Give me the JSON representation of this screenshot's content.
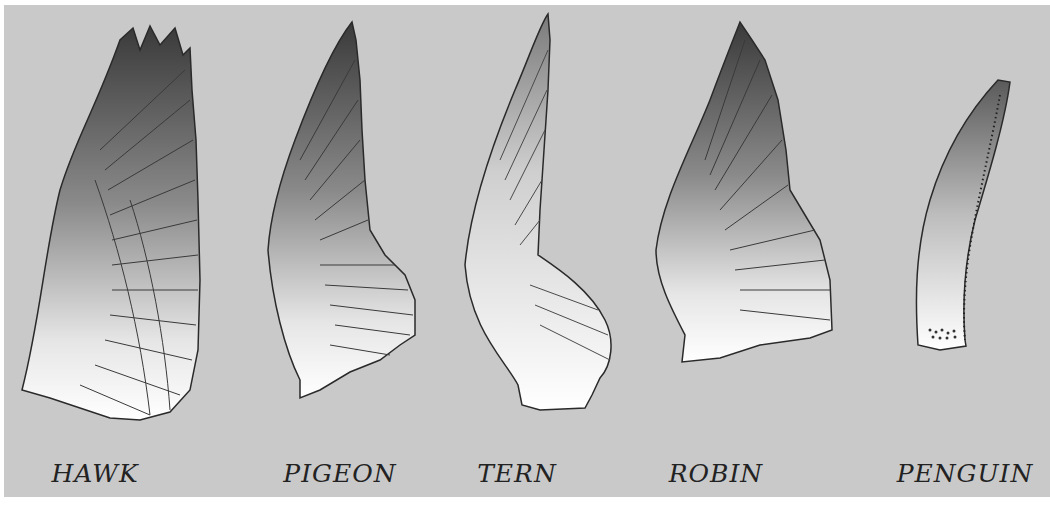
{
  "figure": {
    "background_color": "#c9c9c9",
    "wings": [
      {
        "id": "hawk",
        "label": "HAWK",
        "center_x": 95
      },
      {
        "id": "pigeon",
        "label": "PIGEON",
        "center_x": 340
      },
      {
        "id": "tern",
        "label": "TERN",
        "center_x": 517
      },
      {
        "id": "robin",
        "label": "ROBIN",
        "center_x": 716
      },
      {
        "id": "penguin",
        "label": "PENGUIN",
        "center_x": 965
      }
    ]
  }
}
